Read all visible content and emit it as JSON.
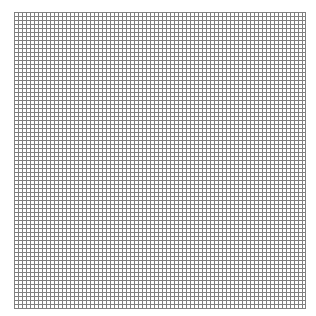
{
  "grid": {
    "line_color": "#6b6b6b",
    "background": "#ffffff",
    "cell_pitch_px": 4,
    "columns": 73,
    "rows": 74
  }
}
